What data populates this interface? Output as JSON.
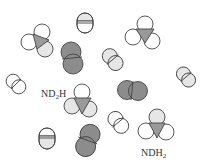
{
  "colors": {
    "white_atom": "#ffffff",
    "light_atom": "#e6e6e6",
    "dark_atom": "#8c8c8c",
    "nitrogen": "#9a9a9a",
    "stroke": "#444444",
    "label": "#333333"
  },
  "labels": {
    "nd2h": {
      "main": "ND",
      "sub": "2",
      "tail": "H"
    },
    "ndh2": {
      "main": "NDH",
      "sub": "2",
      "tail": ""
    }
  },
  "molecules": [
    {
      "id": "ammonia-1",
      "type": "triatomic-amine",
      "atoms": [
        "white",
        "white",
        "light"
      ]
    },
    {
      "id": "hd-1",
      "type": "diatomic",
      "atoms": [
        "light",
        "white"
      ]
    },
    {
      "id": "d2-1",
      "type": "diatomic",
      "atoms": [
        "dark",
        "dark"
      ]
    },
    {
      "id": "ammonia-2",
      "type": "triatomic-amine",
      "atoms": [
        "white",
        "white",
        "white"
      ]
    },
    {
      "id": "hd-2",
      "type": "diatomic",
      "atoms": [
        "light",
        "light"
      ]
    },
    {
      "id": "hd-3",
      "type": "diatomic",
      "atoms": [
        "light",
        "light"
      ]
    },
    {
      "id": "h2-1",
      "type": "diatomic",
      "atoms": [
        "white",
        "white"
      ]
    },
    {
      "id": "nd2h",
      "type": "triatomic-amine",
      "label": "ND2H",
      "atoms": [
        "white",
        "light",
        "light"
      ]
    },
    {
      "id": "d2-2",
      "type": "diatomic",
      "atoms": [
        "dark",
        "dark"
      ]
    },
    {
      "id": "h2-2",
      "type": "diatomic",
      "atoms": [
        "white",
        "white"
      ]
    },
    {
      "id": "ndh2",
      "type": "triatomic-amine",
      "label": "NDH2",
      "atoms": [
        "light",
        "white",
        "white"
      ]
    },
    {
      "id": "hd-4",
      "type": "diatomic",
      "atoms": [
        "white",
        "light"
      ]
    },
    {
      "id": "d2-3",
      "type": "diatomic",
      "atoms": [
        "dark",
        "dark"
      ]
    }
  ]
}
